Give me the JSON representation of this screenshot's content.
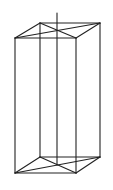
{
  "diagram": {
    "type": "wireframe-rectangular-prism",
    "stroke_color": "#222222",
    "background": "#ffffff",
    "vertices": {
      "top_back_left": [
        40,
        23
      ],
      "top_back_right": [
        100,
        23
      ],
      "top_front_left": [
        15,
        38
      ],
      "top_front_right": [
        76,
        38
      ],
      "bottom_back_left": [
        40,
        157
      ],
      "bottom_back_right": [
        100,
        157
      ],
      "bottom_front_left": [
        15,
        173
      ],
      "bottom_front_right": [
        76,
        173
      ]
    },
    "axis": {
      "x": 57,
      "y_top": 13,
      "y_bottom": 165
    },
    "edges": [
      [
        "top_back_left",
        "top_back_right"
      ],
      [
        "top_back_right",
        "top_front_right"
      ],
      [
        "top_front_right",
        "top_front_left"
      ],
      [
        "top_front_left",
        "top_back_left"
      ],
      [
        "top_back_left",
        "top_front_right"
      ],
      [
        "top_back_right",
        "top_front_left"
      ],
      [
        "bottom_back_left",
        "bottom_back_right"
      ],
      [
        "bottom_back_right",
        "bottom_front_right"
      ],
      [
        "bottom_front_right",
        "bottom_front_left"
      ],
      [
        "bottom_front_left",
        "bottom_back_left"
      ],
      [
        "bottom_back_left",
        "bottom_front_right"
      ],
      [
        "bottom_back_right",
        "bottom_front_left"
      ],
      [
        "top_back_left",
        "bottom_back_left"
      ],
      [
        "top_back_right",
        "bottom_back_right"
      ],
      [
        "top_front_left",
        "bottom_front_left"
      ],
      [
        "top_front_right",
        "bottom_front_right"
      ]
    ]
  }
}
